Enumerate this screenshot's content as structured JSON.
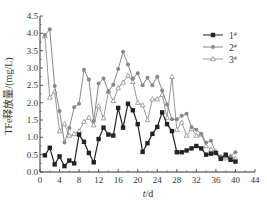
{
  "chart_data": {
    "type": "line",
    "title": "",
    "xlabel": "t/d",
    "ylabel": "TFe释放量/(mg/L)",
    "xlim": [
      0,
      44
    ],
    "ylim": [
      0,
      4.5
    ],
    "xticks": [
      0,
      4,
      8,
      12,
      16,
      20,
      24,
      28,
      32,
      36,
      40,
      44
    ],
    "yticks": [
      "0.0",
      "0.5",
      "1.0",
      "1.5",
      "2.0",
      "2.5",
      "3.0",
      "3.5",
      "4.0",
      "4.5"
    ],
    "grid": false,
    "legend_position": "upper right",
    "x": [
      1,
      2,
      3,
      4,
      5,
      6,
      7,
      8,
      9,
      10,
      11,
      12,
      13,
      14,
      15,
      16,
      17,
      18,
      19,
      20,
      21,
      22,
      23,
      24,
      25,
      26,
      27,
      28,
      29,
      30,
      31,
      32,
      33,
      34,
      35,
      36,
      37,
      38,
      39,
      40
    ],
    "series": [
      {
        "name": "1#",
        "color": "#222222",
        "marker": "square",
        "values": [
          0.48,
          0.7,
          0.22,
          0.45,
          0.17,
          0.33,
          0.25,
          1.08,
          0.87,
          0.55,
          0.28,
          0.95,
          1.28,
          1.08,
          1.05,
          1.85,
          1.28,
          1.97,
          1.78,
          1.38,
          0.58,
          0.83,
          1.1,
          1.3,
          1.72,
          1.38,
          1.18,
          0.57,
          0.57,
          0.62,
          0.68,
          0.75,
          0.68,
          0.5,
          0.53,
          0.55,
          0.38,
          0.5,
          0.35,
          0.3
        ]
      },
      {
        "name": "2#",
        "color": "#888888",
        "marker": "circle",
        "values": [
          3.95,
          4.12,
          2.48,
          1.76,
          0.85,
          1.27,
          1.87,
          1.97,
          2.95,
          2.67,
          1.47,
          2.55,
          2.7,
          2.33,
          2.52,
          2.97,
          3.47,
          3.1,
          2.7,
          2.85,
          2.5,
          2.72,
          2.5,
          2.75,
          2.35,
          1.95,
          1.52,
          1.52,
          1.62,
          1.68,
          1.3,
          1.22,
          1.1,
          0.85,
          0.9,
          0.55,
          0.45,
          0.45,
          0.45,
          0.57
        ]
      },
      {
        "name": "3#",
        "color": "#999999",
        "marker": "triangle",
        "values": [
          3.92,
          2.15,
          2.32,
          1.18,
          1.38,
          1.05,
          1.1,
          1.18,
          1.45,
          1.57,
          1.35,
          1.9,
          1.55,
          2.32,
          2.05,
          2.42,
          2.58,
          2.78,
          2.6,
          2.0,
          1.93,
          1.5,
          2.1,
          2.1,
          2.23,
          1.57,
          2.75,
          1.22,
          1.43,
          1.05,
          1.25,
          1.05,
          1.08,
          0.75,
          0.65,
          0.58,
          0.43,
          0.4,
          0.45,
          0.38
        ]
      }
    ]
  },
  "axis": {
    "x_label_t": "t",
    "x_label_rest": "/d",
    "y_label": "TFe释放量/(mg/L)"
  },
  "legend": [
    {
      "label": "1",
      "sup": "#"
    },
    {
      "label": "2",
      "sup": "#"
    },
    {
      "label": "3",
      "sup": "#"
    }
  ]
}
